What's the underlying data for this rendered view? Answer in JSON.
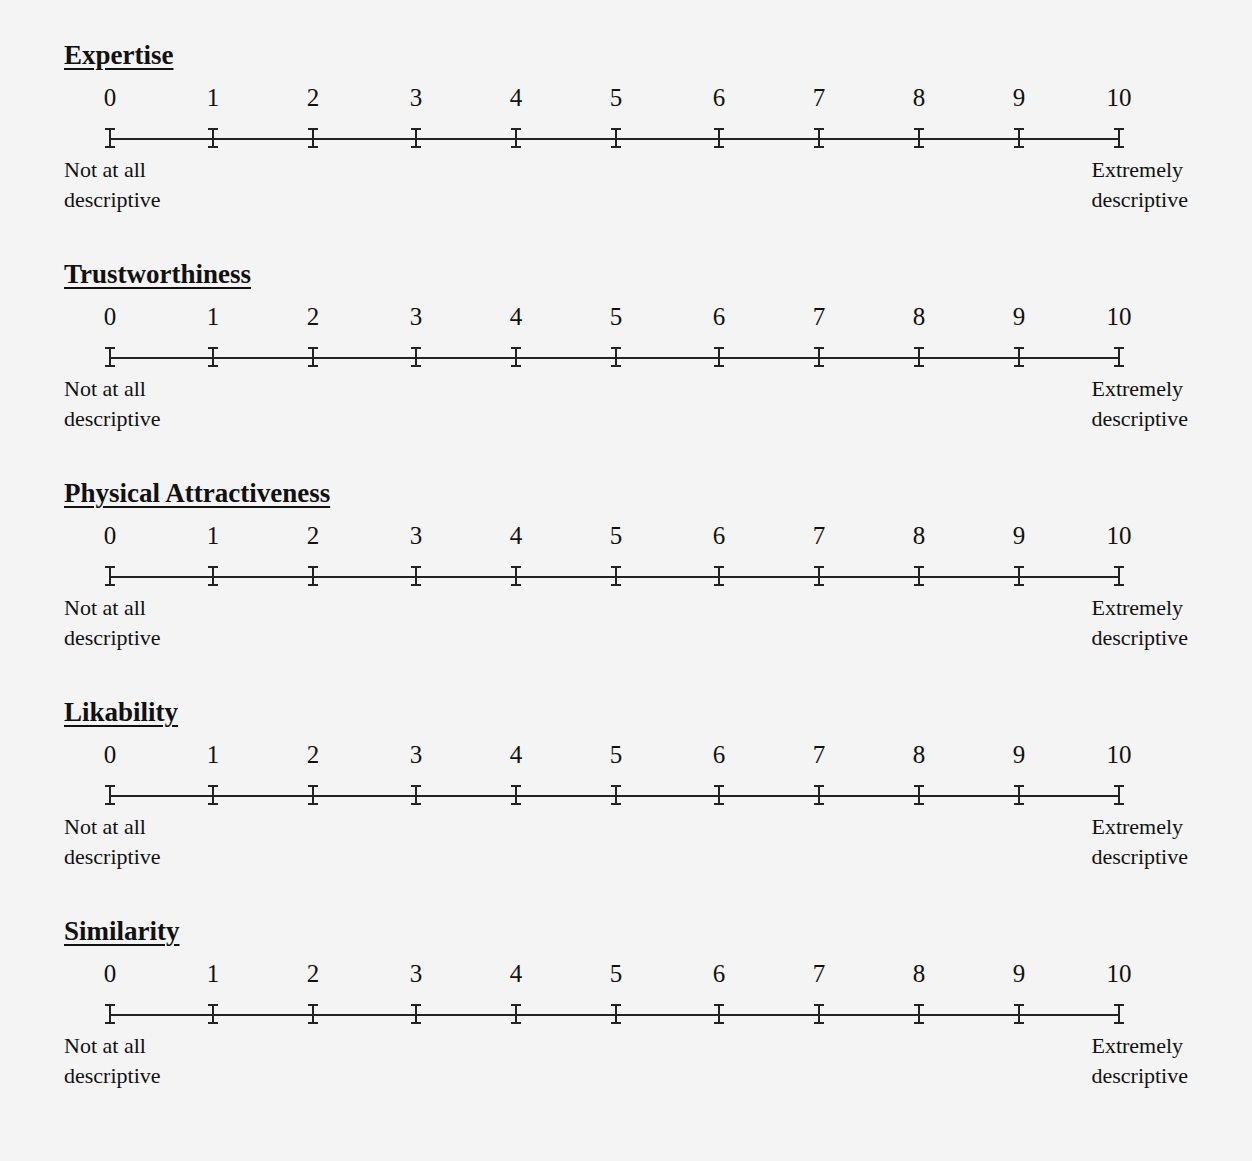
{
  "scale_numbers": [
    "0",
    "1",
    "2",
    "3",
    "4",
    "5",
    "6",
    "7",
    "8",
    "9",
    "10"
  ],
  "scales": [
    {
      "title": "Expertise",
      "low_label_1": "Not at all",
      "low_label_2": "descriptive",
      "high_label_1": "Extremely",
      "high_label_2": "descriptive"
    },
    {
      "title": "Trustworthiness",
      "low_label_1": "Not at all",
      "low_label_2": "descriptive",
      "high_label_1": "Extremely",
      "high_label_2": "descriptive"
    },
    {
      "title": "Physical Attractiveness",
      "low_label_1": "Not at all",
      "low_label_2": "descriptive",
      "high_label_1": "Extremely",
      "high_label_2": "descriptive"
    },
    {
      "title": "Likability",
      "low_label_1": "Not at all",
      "low_label_2": "descriptive",
      "high_label_1": "Extremely",
      "high_label_2": "descriptive"
    },
    {
      "title": "Similarity",
      "low_label_1": "Not at all",
      "low_label_2": "descriptive",
      "high_label_1": "Extremely",
      "high_label_2": "descriptive"
    }
  ]
}
